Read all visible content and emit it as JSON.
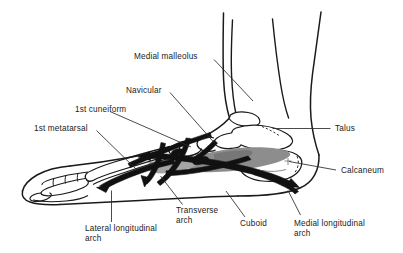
{
  "figure": {
    "colors": {
      "outline": "#1a1a1a",
      "ligament_fill": "#111111",
      "shading_gray": "#8d8d8d",
      "shading_light_gray": "#b9b9b9",
      "leader_line": "#2b2b2b",
      "background": "#ffffff",
      "text": "#1a1a1a"
    }
  },
  "labels": {
    "medial_malleolus": "Medial malleolus",
    "navicular": "Navicular",
    "first_cuneiform": "1st cuneiform",
    "first_metatarsal": "1st metatarsal",
    "talus": "Talus",
    "calcaneum": "Calcaneum",
    "lateral_longitudinal_arch_line1": "Lateral longitudinal",
    "lateral_longitudinal_arch_line2": "arch",
    "transverse_arch_line1": "Transverse",
    "transverse_arch_line2": "arch",
    "cuboid": "Cuboid",
    "medial_longitudinal_arch_line1": "Medial longitudinal",
    "medial_longitudinal_arch_line2": "arch"
  }
}
